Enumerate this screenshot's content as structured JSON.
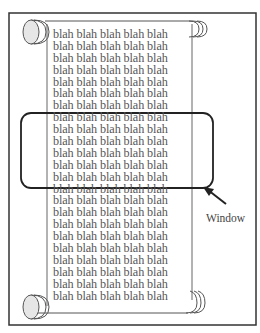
{
  "figure": {
    "scroll_text_line": "blah blah blah blah blah",
    "scroll_line_count": 23,
    "window_label": "Window",
    "colors": {
      "frame": "#333333",
      "scroll_outline": "#555555",
      "roll_fill": "#e6e6e6",
      "text": "#555555",
      "window_outline": "#222222"
    }
  }
}
